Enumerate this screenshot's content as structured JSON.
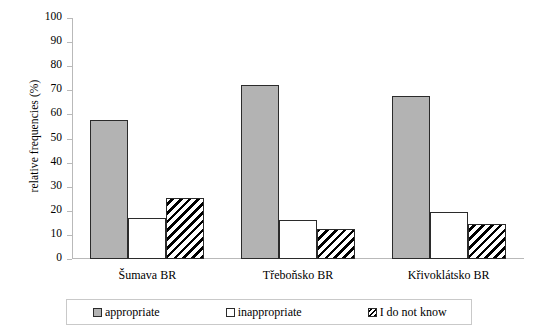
{
  "chart_data": {
    "type": "bar",
    "title": "",
    "xlabel": "",
    "ylabel": "relative frequencies (%)",
    "ylim": [
      0,
      100
    ],
    "yticks": [
      0,
      10,
      20,
      30,
      40,
      50,
      60,
      70,
      80,
      90,
      100
    ],
    "grid": false,
    "legend_position": "bottom",
    "categories": [
      "Šumava BR",
      "Třeboňsko BR",
      "Křivoklátsko BR"
    ],
    "series": [
      {
        "name": "appropriate",
        "values": [
          57.5,
          72.0,
          67.5
        ],
        "color": "#b3b3b3",
        "pattern": "solid"
      },
      {
        "name": "inappropriate",
        "values": [
          17.0,
          16.0,
          19.5
        ],
        "color": "#ffffff",
        "pattern": "empty"
      },
      {
        "name": "I do not know",
        "values": [
          25.5,
          12.5,
          14.5
        ],
        "color": "#000000",
        "pattern": "diagonal-hatch"
      }
    ]
  },
  "axis": {
    "y_title": "relative frequencies (%)",
    "y_tick_labels": [
      "100",
      "90",
      "80",
      "70",
      "60",
      "50",
      "40",
      "30",
      "20",
      "10",
      "0"
    ],
    "x_tick_labels": [
      "Šumava BR",
      "Třeboňsko BR",
      "Křivoklátsko BR"
    ]
  },
  "legend": {
    "items": [
      {
        "label": "appropriate"
      },
      {
        "label": "inappropriate"
      },
      {
        "label": "I do not know"
      }
    ]
  }
}
